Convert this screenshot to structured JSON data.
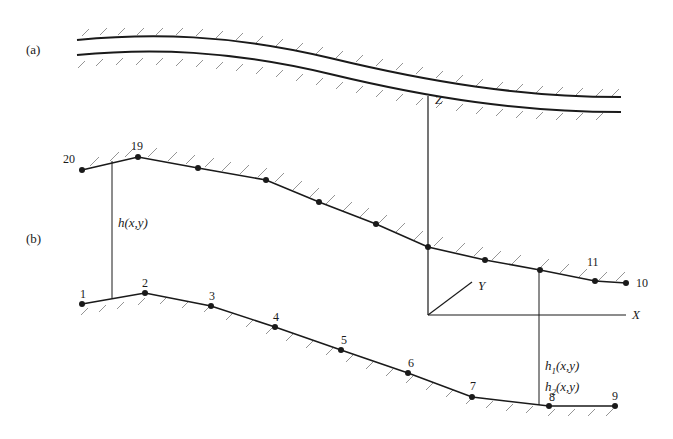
{
  "figure": {
    "panel_a": {
      "label": "(a)",
      "description": "channel between two curved hatched walls"
    },
    "panel_b": {
      "label": "(b)",
      "upper_boundary_labels": [
        "20",
        "19",
        "11",
        "10"
      ],
      "lower_boundary_labels": [
        "1",
        "2",
        "3",
        "4",
        "5",
        "6",
        "7",
        "8",
        "9"
      ],
      "height_label": "h(x,y)",
      "h1_label": "h",
      "h1_sub": "1",
      "h1_args": "(x,y)",
      "h2_label": "h",
      "h2_sub": "2",
      "h2_args": "(x,y)",
      "axes": {
        "z": "Z",
        "y": "Y",
        "x": "X"
      }
    },
    "colors": {
      "line": "#1a1a1a",
      "hatch": "#6e6e6e",
      "background": "#ffffff"
    }
  }
}
